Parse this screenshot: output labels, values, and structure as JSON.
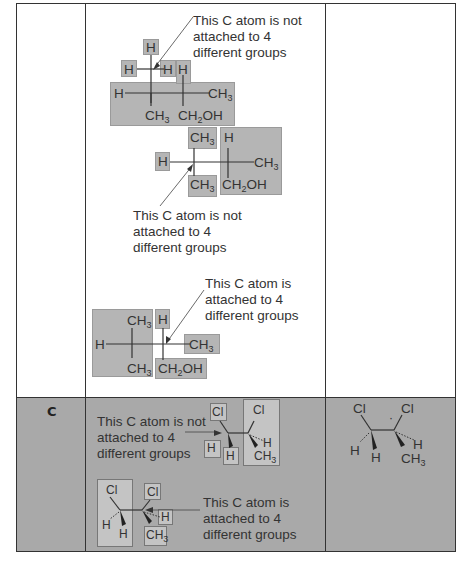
{
  "table": {
    "rows": [
      {
        "label": "",
        "diagrams": [
          {
            "id": "diagram-1",
            "annotation": [
              "This C atom is not",
              "attached to 4",
              "different groups"
            ],
            "atoms": [
              "H",
              "H",
              "H",
              "H",
              "H",
              "CH3",
              "CH3",
              "CH2OH"
            ]
          },
          {
            "id": "diagram-2",
            "annotation": [
              "This C atom is not",
              "attached to 4",
              "different groups"
            ],
            "atoms": [
              "H",
              "CH3",
              "CH3",
              "H",
              "CH3",
              "CH2OH"
            ]
          },
          {
            "id": "diagram-3",
            "annotation": [
              "This C atom is",
              "attached to 4",
              "different groups"
            ],
            "atoms": [
              "H",
              "CH3",
              "CH3",
              "H",
              "CH3",
              "CH2OH"
            ]
          }
        ],
        "answer": ""
      },
      {
        "label": "C",
        "diagrams": [
          {
            "id": "diagram-4",
            "annotation": [
              "This C atom is not",
              "attached to 4",
              "different groups"
            ],
            "atoms": [
              "Cl",
              "H",
              "H",
              "Cl",
              "H",
              "CH3"
            ]
          },
          {
            "id": "diagram-5",
            "annotation": [
              "This C atom is",
              "attached to 4",
              "different groups"
            ],
            "atoms": [
              "Cl",
              "H",
              "H",
              "Cl",
              "H",
              "CH3"
            ]
          }
        ],
        "answer": {
          "atoms": [
            "Cl",
            "Cl",
            "H",
            "H",
            "H",
            "CH3"
          ],
          "marker": "*"
        }
      }
    ]
  },
  "labels": {
    "H": "H",
    "CH": "CH",
    "three": "3",
    "two": "2",
    "OH": "OH",
    "Cl": "Cl",
    "star": "·"
  },
  "colors": {
    "border": "#333333",
    "row2_background": "#a9a9a9",
    "highlight_box": "#b5b5b5"
  }
}
